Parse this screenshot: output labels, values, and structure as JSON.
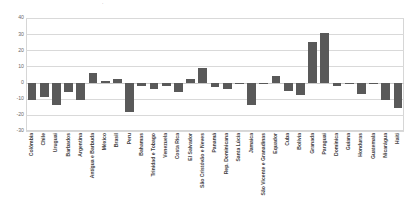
{
  "chart_data": {
    "type": "bar",
    "title": "",
    "xlabel": "",
    "ylabel": "",
    "ylim": [
      -30,
      40
    ],
    "yticks": [
      40,
      30,
      20,
      10,
      0,
      -10,
      -20,
      -30
    ],
    "grid": true,
    "legend": "none",
    "bar_color": "#595959",
    "categories": [
      "Colômbia",
      "Chile",
      "Uruguai",
      "Barbados",
      "Argentina",
      "Antígua e Barbuda",
      "México",
      "Brasil",
      "Peru",
      "Bahamas",
      "Trinidad e Tobago",
      "Venezuela",
      "Costa Rica",
      "El Salvador",
      "São Cristóvão e Neves",
      "Panamá",
      "Rep. Dominicana",
      "Santa Lúcia",
      "Jamaica",
      "São Vicente e Granadinas",
      "Equador",
      "Cuba",
      "Bolívia",
      "Granada",
      "Paraguai",
      "Dominica",
      "Guiana",
      "Honduras",
      "Guatemala",
      "Nicarágua",
      "Haiti"
    ],
    "values": [
      -11,
      -9,
      -14,
      -6,
      -11,
      6,
      1,
      2,
      -18,
      -2,
      -4,
      -2,
      -6,
      2,
      9,
      -3,
      -4,
      -1,
      -14,
      -1,
      4,
      -5,
      -8,
      25,
      31,
      -2,
      -1,
      -7,
      -1,
      -11,
      -16
    ]
  },
  "axis": {
    "tick_labels": [
      "40",
      "30",
      "20",
      "10",
      "0",
      "-10",
      "-20",
      "-30"
    ]
  },
  "title_remnant": {
    "text": "."
  }
}
